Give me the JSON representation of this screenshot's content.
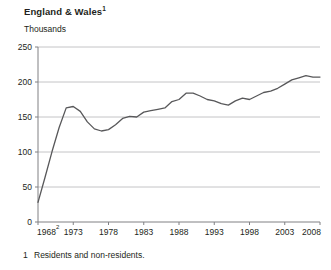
{
  "figure": {
    "title": "England & Wales",
    "title_superscript": "1",
    "unit_label": "Thousands",
    "footnote_number": "1",
    "footnote_text": "Residents and non-residents."
  },
  "chart_data": {
    "type": "line",
    "title": "England & Wales",
    "xlabel": "",
    "ylabel": "Thousands",
    "ylim": [
      0,
      250
    ],
    "xlim": [
      1968,
      2008
    ],
    "yticks": [
      0,
      50,
      100,
      150,
      200,
      250
    ],
    "ytick_labels": [
      "0",
      "50",
      "100",
      "150",
      "200",
      "250"
    ],
    "xticks": [
      1968,
      1973,
      1978,
      1983,
      1988,
      1993,
      1998,
      2003,
      2008
    ],
    "xtick_labels": [
      "1968",
      "1973",
      "1978",
      "1983",
      "1988",
      "1993",
      "1998",
      "2003",
      "2008"
    ],
    "xtick_superscripts": [
      "2",
      "",
      "",
      "",
      "",
      "",
      "",
      "",
      ""
    ],
    "grid": "horizontal",
    "legend": "none",
    "line_color": "#58585a",
    "grid_color": "#b5b5b7",
    "axis_color": "#808083",
    "x": [
      1968,
      1969,
      1970,
      1971,
      1972,
      1973,
      1974,
      1975,
      1976,
      1977,
      1978,
      1979,
      1980,
      1981,
      1982,
      1983,
      1984,
      1985,
      1986,
      1987,
      1988,
      1989,
      1990,
      1991,
      1992,
      1993,
      1994,
      1995,
      1996,
      1997,
      1998,
      1999,
      2000,
      2001,
      2002,
      2003,
      2004,
      2005,
      2006,
      2007,
      2008
    ],
    "values": [
      28,
      64,
      101,
      135,
      163,
      165,
      158,
      143,
      133,
      130,
      132,
      139,
      148,
      151,
      150,
      157,
      159,
      161,
      163,
      172,
      175,
      184,
      184,
      180,
      175,
      173,
      169,
      167,
      173,
      177,
      175,
      180,
      185,
      187,
      191,
      197,
      203,
      206,
      209,
      207,
      207
    ]
  }
}
